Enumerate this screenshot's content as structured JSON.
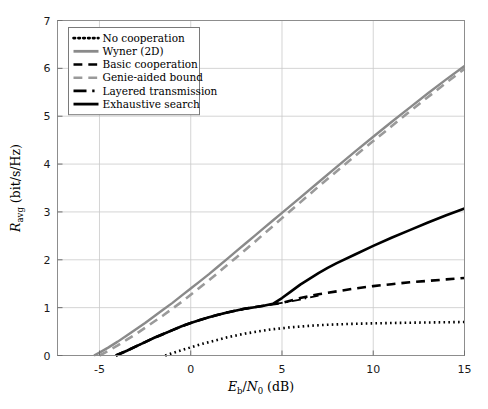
{
  "figure": {
    "background": "#ffffff",
    "frame_color": "#8d8d8d",
    "grid_color": "#c9c9c9"
  },
  "chart_data": {
    "type": "line",
    "title": "",
    "xlabel": "E_b/N_0 (dB)",
    "ylabel": "R_avg (bit/s/Hz)",
    "xlim": [
      -7.3,
      15
    ],
    "ylim": [
      0,
      7
    ],
    "xticks": [
      -5,
      0,
      5,
      10,
      15
    ],
    "yticks": [
      0,
      1,
      2,
      3,
      4,
      5,
      6,
      7
    ],
    "xtick_labels": [
      "-5",
      "0",
      "5",
      "10",
      "15"
    ],
    "ytick_labels": [
      "0",
      "1",
      "2",
      "3",
      "4",
      "5",
      "6",
      "7"
    ],
    "grid": true,
    "legend_position": "upper left",
    "series": [
      {
        "name": "No cooperation",
        "style": "dotted",
        "color": "#000000",
        "width": 2.6,
        "x": [
          -1.4,
          -1.0,
          -0.5,
          0.0,
          0.5,
          1.0,
          1.5,
          2.0,
          2.5,
          3.0,
          3.5,
          4.0,
          4.5,
          5.0,
          5.5,
          6.0,
          6.5,
          7.0,
          7.5,
          8.0,
          9.0,
          10.0,
          11.0,
          12.0,
          13.0,
          14.0,
          15.0
        ],
        "y": [
          0.0,
          0.05,
          0.11,
          0.17,
          0.23,
          0.28,
          0.33,
          0.38,
          0.42,
          0.46,
          0.49,
          0.52,
          0.55,
          0.57,
          0.59,
          0.605,
          0.62,
          0.632,
          0.642,
          0.65,
          0.663,
          0.672,
          0.679,
          0.685,
          0.69,
          0.695,
          0.7
        ]
      },
      {
        "name": "Wyner (2D)",
        "style": "solid",
        "color": "#8a8a8a",
        "width": 2.4,
        "x": [
          -5.3,
          -5.0,
          -4.5,
          -4.0,
          -3.5,
          -3.0,
          -2.5,
          -2.0,
          -1.5,
          -1.0,
          -0.5,
          0.0,
          0.5,
          1.0,
          1.5,
          2.0,
          2.5,
          3.0,
          3.5,
          4.0,
          4.5,
          5.0,
          6.0,
          7.0,
          8.0,
          9.0,
          10.0,
          11.0,
          12.0,
          13.0,
          14.0,
          15.0
        ],
        "y": [
          0.0,
          0.06,
          0.17,
          0.29,
          0.42,
          0.55,
          0.68,
          0.82,
          0.96,
          1.1,
          1.25,
          1.4,
          1.55,
          1.7,
          1.86,
          2.02,
          2.18,
          2.34,
          2.5,
          2.66,
          2.82,
          2.98,
          3.3,
          3.62,
          3.94,
          4.26,
          4.57,
          4.88,
          5.18,
          5.48,
          5.77,
          6.05
        ]
      },
      {
        "name": "Basic cooperation",
        "style": "dashed",
        "color": "#000000",
        "width": 2.6,
        "x": [
          -4.1,
          -3.5,
          -3.0,
          -2.5,
          -2.0,
          -1.5,
          -1.0,
          -0.5,
          0.0,
          0.5,
          1.0,
          1.5,
          2.0,
          2.5,
          3.0,
          3.5,
          4.0,
          4.5,
          5.0,
          5.5,
          6.0,
          6.5,
          7.0,
          8.0,
          9.0,
          10.0,
          11.0,
          12.0,
          13.0,
          14.0,
          15.0
        ],
        "y": [
          0.0,
          0.1,
          0.19,
          0.28,
          0.37,
          0.45,
          0.53,
          0.61,
          0.68,
          0.74,
          0.8,
          0.85,
          0.9,
          0.94,
          0.98,
          1.01,
          1.04,
          1.07,
          1.1,
          1.15,
          1.2,
          1.24,
          1.28,
          1.34,
          1.4,
          1.45,
          1.49,
          1.53,
          1.56,
          1.59,
          1.62
        ]
      },
      {
        "name": "Genie-aided bound",
        "style": "dashed",
        "color": "#9a9a9a",
        "width": 2.6,
        "x": [
          -5.0,
          -4.5,
          -4.0,
          -3.5,
          -3.0,
          -2.5,
          -2.0,
          -1.5,
          -1.0,
          -0.5,
          0.0,
          0.5,
          1.0,
          1.5,
          2.0,
          2.5,
          3.0,
          3.5,
          4.0,
          4.5,
          5.0,
          6.0,
          7.0,
          8.0,
          9.0,
          10.0,
          11.0,
          12.0,
          13.0,
          14.0,
          15.0
        ],
        "y": [
          0.0,
          0.1,
          0.21,
          0.33,
          0.45,
          0.58,
          0.71,
          0.84,
          0.98,
          1.12,
          1.27,
          1.42,
          1.57,
          1.73,
          1.89,
          2.05,
          2.21,
          2.37,
          2.54,
          2.7,
          2.87,
          3.2,
          3.53,
          3.85,
          4.17,
          4.48,
          4.79,
          5.1,
          5.4,
          5.7,
          5.99
        ]
      },
      {
        "name": "Layered transmission",
        "style": "dashdot",
        "color": "#000000",
        "width": 1.8,
        "x": [
          -4.1,
          -3.0,
          -2.0,
          -1.0,
          0.0,
          1.0,
          2.0,
          3.0,
          4.0,
          4.5,
          5.0,
          5.5,
          6.0,
          6.5,
          7.0
        ],
        "y": [
          0.0,
          0.19,
          0.37,
          0.53,
          0.68,
          0.8,
          0.9,
          0.98,
          1.04,
          1.07,
          1.1,
          1.13,
          1.17,
          1.21,
          1.25
        ]
      },
      {
        "name": "Exhaustive search",
        "style": "solid",
        "color": "#000000",
        "width": 2.6,
        "x": [
          -4.1,
          -3.5,
          -3.0,
          -2.5,
          -2.0,
          -1.5,
          -1.0,
          -0.5,
          0.0,
          0.5,
          1.0,
          1.5,
          2.0,
          2.5,
          3.0,
          3.5,
          4.0,
          4.5,
          5.0,
          5.5,
          6.0,
          6.5,
          7.0,
          7.5,
          8.0,
          9.0,
          10.0,
          11.0,
          12.0,
          13.0,
          14.0,
          15.0
        ],
        "y": [
          0.0,
          0.1,
          0.19,
          0.28,
          0.37,
          0.45,
          0.53,
          0.61,
          0.68,
          0.74,
          0.8,
          0.85,
          0.9,
          0.94,
          0.98,
          1.01,
          1.04,
          1.08,
          1.2,
          1.34,
          1.48,
          1.6,
          1.72,
          1.83,
          1.93,
          2.11,
          2.29,
          2.46,
          2.62,
          2.78,
          2.93,
          3.07
        ]
      }
    ]
  },
  "legend": {
    "items": [
      {
        "label": "No cooperation",
        "style": "dotted",
        "color": "#000000"
      },
      {
        "label": "Wyner (2D)",
        "style": "solid",
        "color": "#8a8a8a"
      },
      {
        "label": "Basic cooperation",
        "style": "dashed",
        "color": "#000000"
      },
      {
        "label": "Genie-aided bound",
        "style": "dashed",
        "color": "#9a9a9a"
      },
      {
        "label": "Layered transmission",
        "style": "dashdot",
        "color": "#000000"
      },
      {
        "label": "Exhaustive search",
        "style": "solid",
        "color": "#000000"
      }
    ]
  }
}
